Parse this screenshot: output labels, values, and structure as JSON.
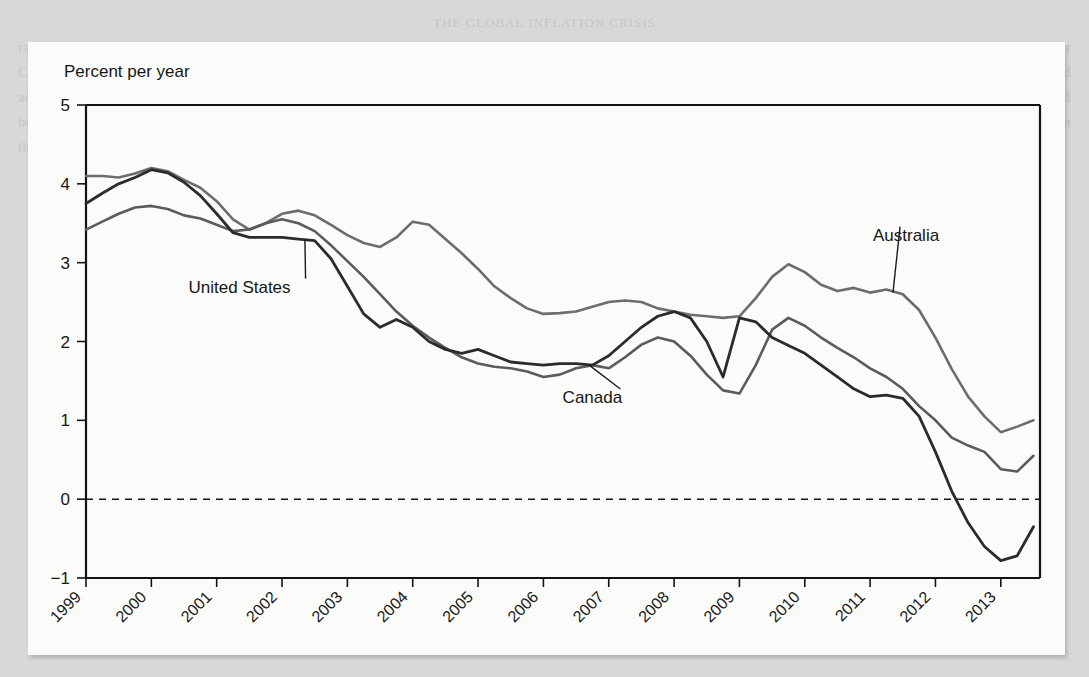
{
  "page": {
    "background_color": "#d8d8d6",
    "card_color": "#fbfbf9",
    "bleed_heading": "THE GLOBAL INFLATION CRISIS",
    "bleed_text": "rates tumbled to near zero. In the United States, core inflation fell steadily through the period, moving into negative territory by 2013, while the comparable measures for Canada and Australia held above zero. The divergence shown here reflects both the depth of the downturn and the differing degrees of monetary accommodation applied across the three economies. Observers noted that the persistence of below-target inflation raised questions about the credibility of the inflation-targeting frameworks that had been adopted in the preceding decades, and about whether conventional policy instruments retained sufficient traction at the effective lower bound of nominal interest rates in these advanced economies."
  },
  "chart_data": {
    "type": "line",
    "title": "",
    "ylabel": "Percent per year",
    "xlabel": "",
    "ylim": [
      -1,
      5
    ],
    "yticks": [
      5,
      4,
      3,
      2,
      1,
      0,
      -1
    ],
    "ytick_labels": [
      "5",
      "4",
      "3",
      "2",
      "1",
      "0",
      "−1"
    ],
    "xlim": [
      1999,
      2013.6
    ],
    "xticks": [
      1999,
      2000,
      2001,
      2002,
      2003,
      2004,
      2005,
      2006,
      2007,
      2008,
      2009,
      2010,
      2011,
      2012,
      2013
    ],
    "xtick_labels": [
      "1999",
      "2000",
      "2001",
      "2002",
      "2003",
      "2004",
      "2005",
      "2006",
      "2007",
      "2008",
      "2009",
      "2010",
      "2011",
      "2012",
      "2013"
    ],
    "grid": false,
    "legend_position": "inline-annotations",
    "zero_reference_line": 0,
    "annotations": [
      {
        "text": "United States",
        "x": 2001.35,
        "y": 2.62,
        "anchor_x": 2002.35,
        "anchor_y": 3.3
      },
      {
        "text": "Canada",
        "x": 2006.75,
        "y": 1.22,
        "anchor_x": 2006.7,
        "anchor_y": 1.7
      },
      {
        "text": "Australia",
        "x": 2011.55,
        "y": 3.28,
        "anchor_x": 2011.35,
        "anchor_y": 2.62
      }
    ],
    "series": [
      {
        "name": "Australia",
        "color": "#6d6d6d",
        "width": 2.6,
        "x": [
          1999.0,
          1999.25,
          1999.5,
          1999.75,
          2000.0,
          2000.25,
          2000.5,
          2000.75,
          2001.0,
          2001.25,
          2001.5,
          2001.75,
          2002.0,
          2002.25,
          2002.5,
          2002.75,
          2003.0,
          2003.25,
          2003.5,
          2003.75,
          2004.0,
          2004.25,
          2004.5,
          2004.75,
          2005.0,
          2005.25,
          2005.5,
          2005.75,
          2006.0,
          2006.25,
          2006.5,
          2006.75,
          2007.0,
          2007.25,
          2007.5,
          2007.75,
          2008.0,
          2008.25,
          2008.5,
          2008.75,
          2009.0,
          2009.25,
          2009.5,
          2009.75,
          2010.0,
          2010.25,
          2010.5,
          2010.75,
          2011.0,
          2011.25,
          2011.5,
          2011.75,
          2012.0,
          2012.25,
          2012.5,
          2012.75,
          2013.0,
          2013.25,
          2013.5
        ],
        "y": [
          4.1,
          4.1,
          4.08,
          4.13,
          4.2,
          4.16,
          4.05,
          3.95,
          3.78,
          3.55,
          3.42,
          3.5,
          3.62,
          3.66,
          3.6,
          3.48,
          3.35,
          3.25,
          3.2,
          3.32,
          3.52,
          3.48,
          3.3,
          3.12,
          2.92,
          2.7,
          2.55,
          2.42,
          2.35,
          2.36,
          2.38,
          2.44,
          2.5,
          2.52,
          2.5,
          2.42,
          2.38,
          2.34,
          2.32,
          2.3,
          2.32,
          2.55,
          2.82,
          2.98,
          2.88,
          2.72,
          2.64,
          2.68,
          2.62,
          2.66,
          2.6,
          2.4,
          2.05,
          1.65,
          1.3,
          1.05,
          0.85,
          0.92,
          1.0
        ]
      },
      {
        "name": "Canada",
        "color": "#5b5b5b",
        "width": 2.6,
        "x": [
          1999.0,
          1999.25,
          1999.5,
          1999.75,
          2000.0,
          2000.25,
          2000.5,
          2000.75,
          2001.0,
          2001.25,
          2001.5,
          2001.75,
          2002.0,
          2002.25,
          2002.5,
          2002.75,
          2003.0,
          2003.25,
          2003.5,
          2003.75,
          2004.0,
          2004.25,
          2004.5,
          2004.75,
          2005.0,
          2005.25,
          2005.5,
          2005.75,
          2006.0,
          2006.25,
          2006.5,
          2006.75,
          2007.0,
          2007.25,
          2007.5,
          2007.75,
          2008.0,
          2008.25,
          2008.5,
          2008.75,
          2009.0,
          2009.25,
          2009.5,
          2009.75,
          2010.0,
          2010.25,
          2010.5,
          2010.75,
          2011.0,
          2011.25,
          2011.5,
          2011.75,
          2012.0,
          2012.25,
          2012.5,
          2012.75,
          2013.0,
          2013.25,
          2013.5
        ],
        "y": [
          3.42,
          3.52,
          3.62,
          3.7,
          3.72,
          3.68,
          3.6,
          3.56,
          3.48,
          3.4,
          3.42,
          3.5,
          3.55,
          3.5,
          3.4,
          3.22,
          3.02,
          2.82,
          2.6,
          2.38,
          2.2,
          2.05,
          1.92,
          1.8,
          1.72,
          1.68,
          1.66,
          1.62,
          1.55,
          1.58,
          1.66,
          1.7,
          1.66,
          1.8,
          1.96,
          2.05,
          2.0,
          1.82,
          1.58,
          1.38,
          1.34,
          1.7,
          2.15,
          2.3,
          2.2,
          2.05,
          1.92,
          1.8,
          1.66,
          1.55,
          1.4,
          1.18,
          1.0,
          0.78,
          0.68,
          0.6,
          0.38,
          0.35,
          0.55
        ]
      },
      {
        "name": "United States",
        "color": "#2b2b2b",
        "width": 2.8,
        "x": [
          1999.0,
          1999.25,
          1999.5,
          1999.75,
          2000.0,
          2000.25,
          2000.5,
          2000.75,
          2001.0,
          2001.25,
          2001.5,
          2001.75,
          2002.0,
          2002.25,
          2002.5,
          2002.75,
          2003.0,
          2003.25,
          2003.5,
          2003.75,
          2004.0,
          2004.25,
          2004.5,
          2004.75,
          2005.0,
          2005.25,
          2005.5,
          2005.75,
          2006.0,
          2006.25,
          2006.5,
          2006.75,
          2007.0,
          2007.25,
          2007.5,
          2007.75,
          2008.0,
          2008.25,
          2008.5,
          2008.75,
          2009.0,
          2009.25,
          2009.5,
          2009.75,
          2010.0,
          2010.25,
          2010.5,
          2010.75,
          2011.0,
          2011.25,
          2011.5,
          2011.75,
          2012.0,
          2012.25,
          2012.5,
          2012.75,
          2013.0,
          2013.25,
          2013.5
        ],
        "y": [
          3.75,
          3.88,
          4.0,
          4.08,
          4.18,
          4.14,
          4.02,
          3.85,
          3.62,
          3.38,
          3.32,
          3.32,
          3.32,
          3.3,
          3.28,
          3.05,
          2.7,
          2.35,
          2.18,
          2.28,
          2.18,
          2.0,
          1.9,
          1.85,
          1.9,
          1.82,
          1.74,
          1.72,
          1.7,
          1.72,
          1.72,
          1.7,
          1.82,
          2.0,
          2.18,
          2.32,
          2.38,
          2.3,
          2.0,
          1.55,
          2.3,
          2.25,
          2.05,
          1.95,
          1.85,
          1.7,
          1.55,
          1.4,
          1.3,
          1.32,
          1.28,
          1.05,
          0.6,
          0.1,
          -0.3,
          -0.6,
          -0.78,
          -0.72,
          -0.35
        ]
      }
    ]
  }
}
